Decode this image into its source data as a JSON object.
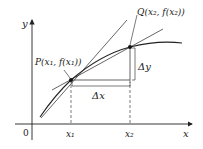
{
  "diagram": {
    "type": "secant-tangent-graph",
    "axes": {
      "x_label": "x",
      "y_label": "y",
      "origin_label": "0"
    },
    "points": {
      "P": {
        "label": "P(x₁, f(x₁))"
      },
      "Q": {
        "label": "Q(x₂, f(x₂))"
      }
    },
    "ticks": {
      "x1": "x₁",
      "x2": "x₂"
    },
    "increments": {
      "dx": "Δx",
      "dy": "Δy"
    },
    "colors": {
      "stroke": "#222222",
      "background": "#ffffff"
    }
  }
}
